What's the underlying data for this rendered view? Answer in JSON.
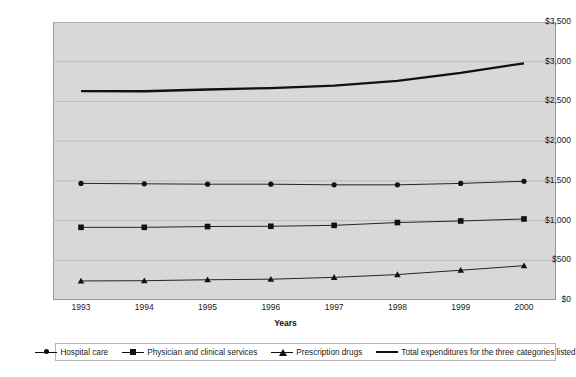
{
  "chart_data": {
    "type": "line",
    "title": "",
    "xlabel": "Years",
    "ylabel": "",
    "categories": [
      "1993",
      "1994",
      "1995",
      "1996",
      "1997",
      "1998",
      "1999",
      "2000"
    ],
    "ylim": [
      0,
      3500
    ],
    "ytick_values": [
      0,
      500,
      1000,
      1500,
      2000,
      2500,
      3000,
      3500
    ],
    "ytick_labels": [
      "$0",
      "$500",
      "$1,000",
      "$1,500",
      "$2,000",
      "$2,500",
      "$3,000",
      "$3,500"
    ],
    "grid": true,
    "legend_position": "bottom",
    "series": [
      {
        "name": "Hospital care",
        "marker": "diamond",
        "values": [
          1468,
          1463,
          1458,
          1458,
          1450,
          1450,
          1468,
          1495
        ]
      },
      {
        "name": "Physician and clinical services",
        "marker": "square",
        "values": [
          915,
          915,
          925,
          928,
          940,
          975,
          995,
          1020
        ]
      },
      {
        "name": "Prescription drugs",
        "marker": "triangle",
        "values": [
          240,
          243,
          255,
          262,
          285,
          320,
          375,
          432
        ]
      },
      {
        "name": "Total expenditures for the three categories listed",
        "marker": "none",
        "values": [
          2630,
          2628,
          2650,
          2668,
          2700,
          2760,
          2860,
          2980
        ]
      }
    ],
    "colors": {
      "line": "#111111",
      "plot_background": "#d8d8d8",
      "gridline": "#bdbdbd",
      "axis": "#8f8f8f"
    }
  }
}
